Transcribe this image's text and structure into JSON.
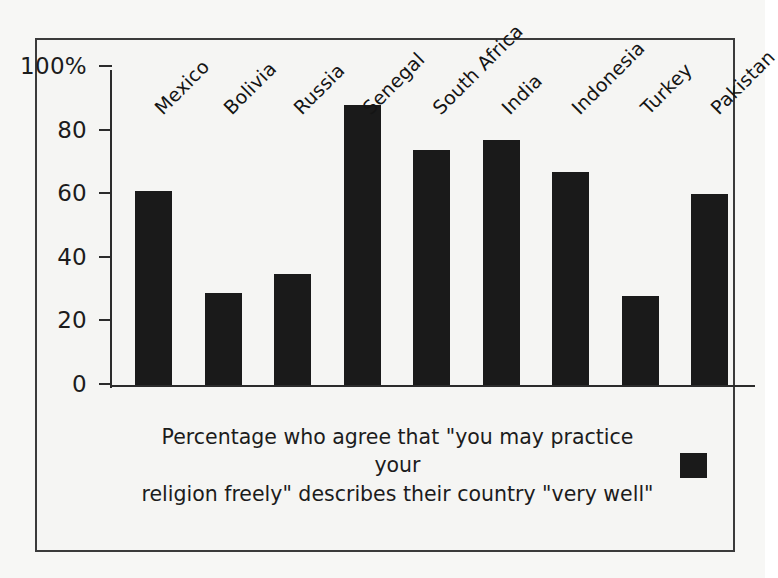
{
  "chart_data": {
    "type": "bar",
    "title": "",
    "subtitle": "",
    "xlabel": "",
    "ylabel": "",
    "ylim": [
      0,
      100
    ],
    "grid": false,
    "legend_position": "bottom",
    "bar_color": "#1a1a1a",
    "categories": [
      "Mexico",
      "Bolivia",
      "Russia",
      "Senegal",
      "South Africa",
      "India",
      "Indonesia",
      "Turkey",
      "Pakistan"
    ],
    "values": [
      61,
      29,
      35,
      88,
      74,
      77,
      67,
      28,
      60
    ],
    "y_ticks": [
      {
        "value": 100,
        "label": "100%"
      },
      {
        "value": 80,
        "label": "80"
      },
      {
        "value": 60,
        "label": "60"
      },
      {
        "value": 40,
        "label": "40"
      },
      {
        "value": 20,
        "label": "20"
      },
      {
        "value": 0,
        "label": "0"
      }
    ],
    "series": [
      {
        "name": "Percentage who agree that \"you may practice your religion freely\" describes their country \"very well\"",
        "values": [
          61,
          29,
          35,
          88,
          74,
          77,
          67,
          28,
          60
        ]
      }
    ]
  },
  "legend": {
    "line1": "Percentage who agree that \"you may practice your",
    "line2": "religion freely\" describes their country \"very well\"",
    "swatch_color": "#1a1a1a"
  }
}
